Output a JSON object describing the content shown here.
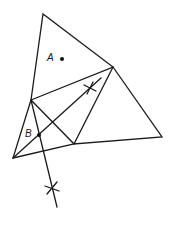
{
  "diagram": {
    "type": "geometric-construction",
    "colors": {
      "stroke": "#1a1a1a",
      "background": "#ffffff"
    },
    "vertices": {
      "top": [
        43,
        14
      ],
      "upper_right": [
        113,
        67
      ],
      "right": [
        162,
        137
      ],
      "left_mid": [
        31,
        100
      ],
      "bottom_left": [
        13,
        158
      ],
      "mid_bottom": [
        74,
        144
      ]
    },
    "points": [
      {
        "label": "A",
        "dot": [
          62,
          59
        ],
        "label_pos": [
          48,
          60
        ]
      },
      {
        "label": "B",
        "dot": [
          39,
          135
        ],
        "label_pos": [
          25,
          136
        ]
      }
    ],
    "construction_marks": [
      {
        "name": "upper-arc-cross",
        "center": [
          90,
          88
        ]
      },
      {
        "name": "lower-arc-cross",
        "center": [
          52,
          188
        ]
      }
    ],
    "lines": {
      "bisector_upper": {
        "from": [
          13,
          158
        ],
        "to": [
          101,
          78
        ]
      },
      "bisector_lower": {
        "from": [
          31,
          100
        ],
        "to": [
          57,
          207
        ]
      }
    }
  }
}
